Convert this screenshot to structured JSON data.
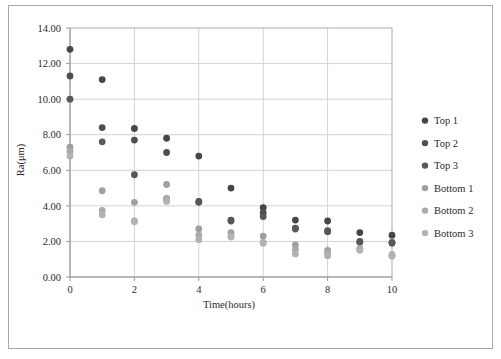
{
  "chart_data": {
    "type": "scatter",
    "title": "",
    "xlabel": "Time(hours)",
    "ylabel": "Ra(μm)",
    "xlim": [
      0,
      10
    ],
    "ylim": [
      0,
      14
    ],
    "xticks": [
      "0",
      "2",
      "4",
      "6",
      "8",
      "10"
    ],
    "yticks": [
      "0.00",
      "2.00",
      "4.00",
      "6.00",
      "8.00",
      "10.00",
      "12.00",
      "14.00"
    ],
    "grid": true,
    "legend_position": "right",
    "colors": {
      "top": "#4a4a4a",
      "bottom": "#a6a6a6",
      "grid": "#d2d2d2",
      "frame": "#a8a8a8",
      "text": "#2b2b2b"
    },
    "series": [
      {
        "name": "Top 1",
        "color": "#464646",
        "x": [
          0,
          1,
          2,
          3,
          4,
          5,
          6,
          7,
          8,
          9,
          10
        ],
        "y": [
          12.8,
          11.1,
          8.35,
          7.8,
          6.8,
          5.0,
          3.9,
          3.2,
          3.15,
          2.5,
          2.35
        ]
      },
      {
        "name": "Top 2",
        "color": "#4f4f4f",
        "x": [
          0,
          1,
          2,
          3,
          4,
          5,
          6,
          7,
          8,
          9,
          10
        ],
        "y": [
          11.3,
          8.4,
          7.7,
          7.0,
          4.25,
          3.2,
          3.6,
          2.75,
          2.6,
          2.0,
          1.95
        ]
      },
      {
        "name": "Top 3",
        "color": "#585858",
        "x": [
          0,
          1,
          2,
          3,
          4,
          5,
          6,
          7,
          8,
          9,
          10
        ],
        "y": [
          10.0,
          7.6,
          5.75,
          4.4,
          4.2,
          3.15,
          3.4,
          2.7,
          2.55,
          1.95,
          1.9
        ]
      },
      {
        "name": "Bottom 1",
        "color": "#a0a0a0",
        "x": [
          0,
          1,
          2,
          3,
          4,
          5,
          6,
          7,
          8,
          9,
          10
        ],
        "y": [
          7.3,
          4.85,
          4.2,
          5.2,
          2.7,
          2.5,
          2.3,
          1.8,
          1.5,
          1.6,
          1.25
        ]
      },
      {
        "name": "Bottom 2",
        "color": "#aaaaaa",
        "x": [
          0,
          1,
          2,
          3,
          4,
          5,
          6,
          7,
          8,
          9,
          10
        ],
        "y": [
          7.05,
          3.75,
          3.15,
          4.4,
          2.35,
          2.3,
          1.95,
          1.55,
          1.35,
          1.55,
          1.2
        ]
      },
      {
        "name": "Bottom 3",
        "color": "#b2b2b2",
        "x": [
          0,
          1,
          2,
          3,
          4,
          5,
          6,
          7,
          8,
          9,
          10
        ],
        "y": [
          6.8,
          3.5,
          3.1,
          4.25,
          2.1,
          2.25,
          1.9,
          1.3,
          1.2,
          1.5,
          1.18
        ]
      }
    ]
  },
  "legend": {
    "items": [
      {
        "label": "Top 1"
      },
      {
        "label": "Top 2"
      },
      {
        "label": "Top 3"
      },
      {
        "label": "Bottom 1"
      },
      {
        "label": "Bottom 2"
      },
      {
        "label": "Bottom 3"
      }
    ]
  }
}
